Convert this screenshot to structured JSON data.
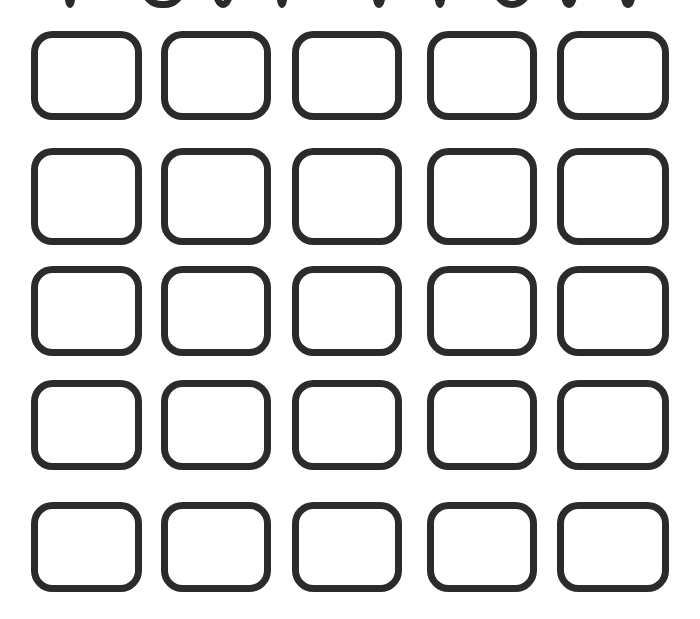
{
  "page": {
    "width": 700,
    "height": 619,
    "background_color": "#ffffff",
    "stroke_color": "#2b2b2b",
    "fill_color": "#ffffff"
  },
  "grid": {
    "rows": 5,
    "columns": 5,
    "total_cells": 25,
    "shape_name": "rounded-square",
    "stroke_width": 7,
    "corner_radius": 18,
    "row_tops": [
      31,
      148,
      266,
      380,
      502
    ],
    "row_bottoms": [
      120,
      245,
      356,
      470,
      592
    ],
    "column_lefts": [
      31,
      161,
      292,
      427,
      557
    ],
    "column_rights": [
      142,
      271,
      402,
      537,
      669
    ],
    "cells": [
      {
        "id": "cell-r1-c1",
        "row": 1,
        "col": 1,
        "x": 31,
        "y": 31,
        "w": 111,
        "h": 89,
        "label": ""
      },
      {
        "id": "cell-r1-c2",
        "row": 1,
        "col": 2,
        "x": 161,
        "y": 31,
        "w": 110,
        "h": 89,
        "label": ""
      },
      {
        "id": "cell-r1-c3",
        "row": 1,
        "col": 3,
        "x": 292,
        "y": 31,
        "w": 110,
        "h": 89,
        "label": ""
      },
      {
        "id": "cell-r1-c4",
        "row": 1,
        "col": 4,
        "x": 427,
        "y": 31,
        "w": 110,
        "h": 89,
        "label": ""
      },
      {
        "id": "cell-r1-c5",
        "row": 1,
        "col": 5,
        "x": 557,
        "y": 31,
        "w": 112,
        "h": 89,
        "label": ""
      },
      {
        "id": "cell-r2-c1",
        "row": 2,
        "col": 1,
        "x": 31,
        "y": 148,
        "w": 111,
        "h": 97,
        "label": ""
      },
      {
        "id": "cell-r2-c2",
        "row": 2,
        "col": 2,
        "x": 161,
        "y": 148,
        "w": 110,
        "h": 97,
        "label": ""
      },
      {
        "id": "cell-r2-c3",
        "row": 2,
        "col": 3,
        "x": 292,
        "y": 148,
        "w": 110,
        "h": 97,
        "label": ""
      },
      {
        "id": "cell-r2-c4",
        "row": 2,
        "col": 4,
        "x": 427,
        "y": 148,
        "w": 110,
        "h": 97,
        "label": ""
      },
      {
        "id": "cell-r2-c5",
        "row": 2,
        "col": 5,
        "x": 557,
        "y": 148,
        "w": 112,
        "h": 97,
        "label": ""
      },
      {
        "id": "cell-r3-c1",
        "row": 3,
        "col": 1,
        "x": 31,
        "y": 266,
        "w": 111,
        "h": 90,
        "label": ""
      },
      {
        "id": "cell-r3-c2",
        "row": 3,
        "col": 2,
        "x": 161,
        "y": 266,
        "w": 110,
        "h": 90,
        "label": ""
      },
      {
        "id": "cell-r3-c3",
        "row": 3,
        "col": 3,
        "x": 292,
        "y": 266,
        "w": 110,
        "h": 90,
        "label": ""
      },
      {
        "id": "cell-r3-c4",
        "row": 3,
        "col": 4,
        "x": 427,
        "y": 266,
        "w": 110,
        "h": 90,
        "label": ""
      },
      {
        "id": "cell-r3-c5",
        "row": 3,
        "col": 5,
        "x": 557,
        "y": 266,
        "w": 112,
        "h": 90,
        "label": ""
      },
      {
        "id": "cell-r4-c1",
        "row": 4,
        "col": 1,
        "x": 31,
        "y": 380,
        "w": 111,
        "h": 90,
        "label": ""
      },
      {
        "id": "cell-r4-c2",
        "row": 4,
        "col": 2,
        "x": 161,
        "y": 380,
        "w": 110,
        "h": 90,
        "label": ""
      },
      {
        "id": "cell-r4-c3",
        "row": 4,
        "col": 3,
        "x": 292,
        "y": 380,
        "w": 110,
        "h": 90,
        "label": ""
      },
      {
        "id": "cell-r4-c4",
        "row": 4,
        "col": 4,
        "x": 427,
        "y": 380,
        "w": 110,
        "h": 90,
        "label": ""
      },
      {
        "id": "cell-r4-c5",
        "row": 4,
        "col": 5,
        "x": 557,
        "y": 380,
        "w": 112,
        "h": 90,
        "label": ""
      },
      {
        "id": "cell-r5-c1",
        "row": 5,
        "col": 1,
        "x": 31,
        "y": 502,
        "w": 111,
        "h": 90,
        "label": ""
      },
      {
        "id": "cell-r5-c2",
        "row": 5,
        "col": 2,
        "x": 161,
        "y": 502,
        "w": 110,
        "h": 90,
        "label": ""
      },
      {
        "id": "cell-r5-c3",
        "row": 5,
        "col": 3,
        "x": 292,
        "y": 502,
        "w": 110,
        "h": 90,
        "label": ""
      },
      {
        "id": "cell-r5-c4",
        "row": 5,
        "col": 4,
        "x": 427,
        "y": 502,
        "w": 110,
        "h": 90,
        "label": ""
      },
      {
        "id": "cell-r5-c5",
        "row": 5,
        "col": 5,
        "x": 557,
        "y": 502,
        "w": 112,
        "h": 90,
        "label": ""
      }
    ]
  },
  "clipped_top_row": {
    "description": "partially visible bottom edges of an earlier row, cropped by the top of the image",
    "visible_height": 8,
    "fragments": [
      {
        "id": "fragment-1",
        "x": 64,
        "y": -82,
        "w": 12,
        "h": 90
      },
      {
        "id": "fragment-2",
        "x": 140,
        "y": -82,
        "w": 46,
        "h": 90
      },
      {
        "id": "fragment-3",
        "x": 212,
        "y": -82,
        "w": 22,
        "h": 90
      },
      {
        "id": "fragment-4",
        "x": 276,
        "y": -82,
        "w": 12,
        "h": 90
      },
      {
        "id": "fragment-5",
        "x": 372,
        "y": -82,
        "w": 14,
        "h": 90
      },
      {
        "id": "fragment-6",
        "x": 434,
        "y": -82,
        "w": 12,
        "h": 90
      },
      {
        "id": "fragment-7",
        "x": 492,
        "y": -82,
        "w": 40,
        "h": 90
      },
      {
        "id": "fragment-8",
        "x": 560,
        "y": -82,
        "w": 18,
        "h": 90
      },
      {
        "id": "fragment-9",
        "x": 620,
        "y": -82,
        "w": 16,
        "h": 90
      }
    ]
  }
}
